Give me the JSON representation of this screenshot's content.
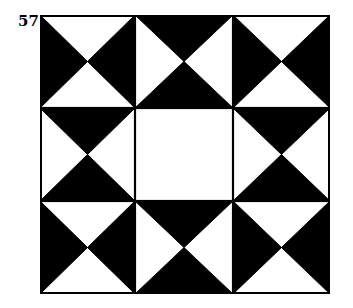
{
  "figure": {
    "number_label": "57",
    "colors": {
      "dark": "#000000",
      "light": "#ffffff",
      "outline": "#000000"
    },
    "grid": {
      "rows": 3,
      "cols": 3,
      "cells": [
        {
          "row": 0,
          "col": 0,
          "type": "hourglass",
          "dark_triangles": [
            "left",
            "right"
          ]
        },
        {
          "row": 0,
          "col": 1,
          "type": "hourglass",
          "dark_triangles": [
            "top",
            "bottom"
          ]
        },
        {
          "row": 0,
          "col": 2,
          "type": "hourglass",
          "dark_triangles": [
            "left",
            "right"
          ]
        },
        {
          "row": 1,
          "col": 0,
          "type": "hourglass",
          "dark_triangles": [
            "top",
            "bottom"
          ]
        },
        {
          "row": 1,
          "col": 1,
          "type": "plain",
          "dark_triangles": []
        },
        {
          "row": 1,
          "col": 2,
          "type": "hourglass",
          "dark_triangles": [
            "top",
            "bottom"
          ]
        },
        {
          "row": 2,
          "col": 0,
          "type": "hourglass",
          "dark_triangles": [
            "left",
            "right"
          ]
        },
        {
          "row": 2,
          "col": 1,
          "type": "hourglass",
          "dark_triangles": [
            "top",
            "bottom"
          ]
        },
        {
          "row": 2,
          "col": 2,
          "type": "hourglass",
          "dark_triangles": [
            "left",
            "right"
          ]
        }
      ]
    }
  }
}
